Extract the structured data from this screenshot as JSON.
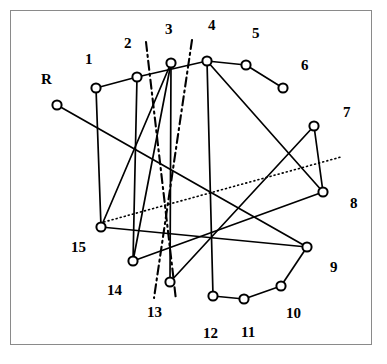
{
  "figure": {
    "background_color": "#ffffff",
    "frame": {
      "name": "figure-border",
      "color": "#8a8a8a",
      "x": 10,
      "y": 10,
      "width": 362,
      "height": 335
    },
    "style": {
      "edge_color": "#000000",
      "node_stroke": "#000000",
      "node_fill": "#ffffff",
      "label_color": "#000000",
      "node_radius": 4.6,
      "edge_width": 1.7,
      "label_font_size": 15
    }
  },
  "nodes": [
    {
      "id": "R",
      "label": "R",
      "cx": 57,
      "cy": 105,
      "label_x": 41,
      "label_y": 72
    },
    {
      "id": "1",
      "label": "1",
      "cx": 96,
      "cy": 88,
      "label_x": 85,
      "label_y": 52
    },
    {
      "id": "2",
      "label": "2",
      "cx": 137,
      "cy": 77,
      "label_x": 124,
      "label_y": 36
    },
    {
      "id": "3",
      "label": "3",
      "cx": 171,
      "cy": 63,
      "label_x": 165,
      "label_y": 22
    },
    {
      "id": "4",
      "label": "4",
      "cx": 207,
      "cy": 61,
      "label_x": 208,
      "label_y": 18
    },
    {
      "id": "5",
      "label": "5",
      "cx": 246,
      "cy": 65,
      "label_x": 252,
      "label_y": 26
    },
    {
      "id": "6",
      "label": "6",
      "cx": 283,
      "cy": 88,
      "label_x": 301,
      "label_y": 58
    },
    {
      "id": "7",
      "label": "7",
      "cx": 314,
      "cy": 126,
      "label_x": 343,
      "label_y": 105
    },
    {
      "id": "8",
      "label": "8",
      "cx": 323,
      "cy": 192,
      "label_x": 350,
      "label_y": 196
    },
    {
      "id": "9",
      "label": "9",
      "cx": 307,
      "cy": 247,
      "label_x": 330,
      "label_y": 260
    },
    {
      "id": "10",
      "label": "10",
      "cx": 281,
      "cy": 286,
      "label_x": 286,
      "label_y": 306
    },
    {
      "id": "11",
      "label": "11",
      "cx": 244,
      "cy": 299,
      "label_x": 241,
      "label_y": 325
    },
    {
      "id": "12",
      "label": "12",
      "cx": 213,
      "cy": 296,
      "label_x": 203,
      "label_y": 326
    },
    {
      "id": "13",
      "label": "13",
      "cx": 170,
      "cy": 282,
      "label_x": 147,
      "label_y": 305
    },
    {
      "id": "14",
      "label": "14",
      "cx": 133,
      "cy": 261,
      "label_x": 107,
      "label_y": 283
    },
    {
      "id": "15",
      "label": "15",
      "cx": 101,
      "cy": 227,
      "label_x": 71,
      "label_y": 240
    }
  ],
  "edges": [
    {
      "name": "edge-R-9",
      "from": "R",
      "to": "9"
    },
    {
      "name": "edge-1-2",
      "from": "1",
      "to": "2"
    },
    {
      "name": "edge-1-15",
      "from": "1",
      "to": "15"
    },
    {
      "name": "edge-2-14",
      "from": "2",
      "to": "14"
    },
    {
      "name": "edge-2-4",
      "from": "2",
      "to": "4"
    },
    {
      "name": "edge-3-13",
      "from": "3",
      "to": "13"
    },
    {
      "name": "edge-3-14",
      "from": "3",
      "to": "14"
    },
    {
      "name": "edge-4-12",
      "from": "4",
      "to": "12"
    },
    {
      "name": "edge-4-5",
      "from": "4",
      "to": "5"
    },
    {
      "name": "edge-4-8",
      "from": "4",
      "to": "8"
    },
    {
      "name": "edge-5-6",
      "from": "5",
      "to": "6"
    },
    {
      "name": "edge-7-8",
      "from": "7",
      "to": "8"
    },
    {
      "name": "edge-7-13",
      "from": "7",
      "to": "13"
    },
    {
      "name": "edge-8-14",
      "from": "8",
      "to": "14"
    },
    {
      "name": "edge-9-15",
      "from": "9",
      "to": "15"
    },
    {
      "name": "edge-9-10",
      "from": "9",
      "to": "10"
    },
    {
      "name": "edge-10-11",
      "from": "10",
      "to": "11"
    },
    {
      "name": "edge-11-12",
      "from": "11",
      "to": "12"
    },
    {
      "name": "edge-3-15b",
      "from": "3",
      "to": "15"
    }
  ],
  "cut_lines": [
    {
      "name": "cut-line-left",
      "style": "dash-dot",
      "x1": 146,
      "y1": 42,
      "x2": 176,
      "y2": 300
    },
    {
      "name": "cut-line-right",
      "style": "dash-dot",
      "x1": 192,
      "y1": 40,
      "x2": 154,
      "y2": 298
    }
  ],
  "dotted_lines": [
    {
      "name": "dotted-separator",
      "style": "dotted",
      "x1": 104,
      "y1": 222,
      "x2": 341,
      "y2": 157
    }
  ]
}
